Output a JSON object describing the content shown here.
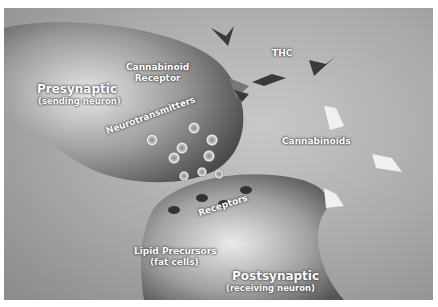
{
  "diagram": {
    "labels": {
      "presynaptic": "Presynaptic",
      "presynaptic_sub": "(sending neuron)",
      "cannabinoid_receptor_line1": "Cannabinoid",
      "cannabinoid_receptor_line2": "Receptor",
      "thc": "THC",
      "neurotransmitters": "Neurotransmitters",
      "cannabinoids": "Cannabinoids",
      "receptors": "Receptors",
      "lipid_precursors": "Lipid Precursors",
      "lipid_precursors_sub": "(fat cells)",
      "postsynaptic": "Postsynaptic",
      "postsynaptic_sub": "(receiving neuron)"
    },
    "colors": {
      "background": "#a9a9a9",
      "neuron_light": "#d9d9d9",
      "neuron_dark": "#5a5a5a",
      "thc_dark": "#3a3a3a",
      "cannabinoid_light": "#eeeeee",
      "label_text": "#ffffff"
    }
  }
}
